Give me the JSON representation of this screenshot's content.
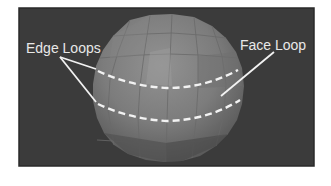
{
  "figure": {
    "background_color": "#ffffff",
    "frame_color": "#3b3b3b",
    "sphere_colors": {
      "light": "#8c8c8c",
      "mid": "#7a7a7a",
      "dark": "#5e5e5e",
      "shadow": "#4e4e4e"
    },
    "annotation_color": "#f2f2f2",
    "labels": {
      "edge_loops": "Edge Loops",
      "face_loop": "Face Loop"
    }
  }
}
